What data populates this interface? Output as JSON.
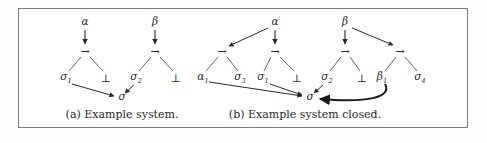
{
  "figure": {
    "frame_color": "#7d7d7d",
    "ink_color": "#2a2a2a",
    "background": "#ffffff",
    "captions": [
      {
        "id": "caption-a",
        "text": "(a) Example system.",
        "x": 122,
        "y": 114
      },
      {
        "id": "caption-b",
        "text": "(b) Example system closed.",
        "x": 305,
        "y": 114
      }
    ],
    "panels": [
      {
        "id": "panel-a",
        "label": "(a) Example system.",
        "nodes": [
          {
            "id": "a-alpha",
            "kind": "variable",
            "text": "α",
            "sub": "",
            "x": 85,
            "y": 23
          },
          {
            "id": "a-arrow1",
            "kind": "operator",
            "text": "→",
            "sub": "",
            "x": 85,
            "y": 51
          },
          {
            "id": "a-sigma1",
            "kind": "variable",
            "text": "σ",
            "sub": "1",
            "x": 66,
            "y": 78
          },
          {
            "id": "a-bot1",
            "kind": "operator",
            "text": "⊥",
            "sub": "",
            "x": 106,
            "y": 78
          },
          {
            "id": "a-beta",
            "kind": "variable",
            "text": "β",
            "sub": "",
            "x": 155,
            "y": 23
          },
          {
            "id": "a-arrow2",
            "kind": "operator",
            "text": "→",
            "sub": "",
            "x": 155,
            "y": 51
          },
          {
            "id": "a-sigma2",
            "kind": "variable",
            "text": "σ",
            "sub": "2",
            "x": 136,
            "y": 78
          },
          {
            "id": "a-bot2",
            "kind": "operator",
            "text": "⊥",
            "sub": "",
            "x": 176,
            "y": 78
          },
          {
            "id": "a-sigma",
            "kind": "variable",
            "text": "σ",
            "sub": "",
            "x": 122,
            "y": 98
          }
        ],
        "edges": [
          {
            "id": "a-edge-alpha-arrow1",
            "from": "a-alpha",
            "to": "a-arrow1",
            "style": "straight-arrow"
          },
          {
            "id": "a-edge-arrow1-sigma1",
            "from": "a-arrow1",
            "to": "a-sigma1",
            "style": "plain-line"
          },
          {
            "id": "a-edge-arrow1-bot1",
            "from": "a-arrow1",
            "to": "a-bot1",
            "style": "plain-line"
          },
          {
            "id": "a-edge-beta-arrow2",
            "from": "a-beta",
            "to": "a-arrow2",
            "style": "straight-arrow"
          },
          {
            "id": "a-edge-arrow2-sigma2",
            "from": "a-arrow2",
            "to": "a-sigma2",
            "style": "plain-line"
          },
          {
            "id": "a-edge-arrow2-bot2",
            "from": "a-arrow2",
            "to": "a-bot2",
            "style": "plain-line"
          },
          {
            "id": "a-edge-sigma1-sigma",
            "from": "a-sigma1",
            "to": "a-sigma",
            "style": "straight-arrow"
          },
          {
            "id": "a-edge-sigma2-sigma",
            "from": "a-sigma2",
            "to": "a-sigma",
            "style": "straight-arrow"
          }
        ]
      },
      {
        "id": "panel-b",
        "label": "(b) Example system closed.",
        "nodes": [
          {
            "id": "b-alpha",
            "kind": "variable",
            "text": "α",
            "sub": "",
            "x": 275,
            "y": 23
          },
          {
            "id": "b-arrow1",
            "kind": "operator",
            "text": "→",
            "sub": "",
            "x": 222,
            "y": 51
          },
          {
            "id": "b-arrow2",
            "kind": "operator",
            "text": "→",
            "sub": "",
            "x": 275,
            "y": 51
          },
          {
            "id": "b-alpha1",
            "kind": "variable",
            "text": "α",
            "sub": "1",
            "x": 203,
            "y": 78
          },
          {
            "id": "b-sigma3",
            "kind": "variable",
            "text": "σ",
            "sub": "3",
            "x": 240,
            "y": 78
          },
          {
            "id": "b-sigma1",
            "kind": "variable",
            "text": "σ",
            "sub": "1",
            "x": 263,
            "y": 78
          },
          {
            "id": "b-bot1",
            "kind": "operator",
            "text": "⊥",
            "sub": "",
            "x": 297,
            "y": 78
          },
          {
            "id": "b-beta",
            "kind": "variable",
            "text": "β",
            "sub": "",
            "x": 345,
            "y": 23
          },
          {
            "id": "b-arrow3",
            "kind": "operator",
            "text": "→",
            "sub": "",
            "x": 345,
            "y": 51
          },
          {
            "id": "b-arrow4",
            "kind": "operator",
            "text": "→",
            "sub": "",
            "x": 400,
            "y": 51
          },
          {
            "id": "b-sigma2",
            "kind": "variable",
            "text": "σ",
            "sub": "2",
            "x": 327,
            "y": 78
          },
          {
            "id": "b-bot2",
            "kind": "operator",
            "text": "⊥",
            "sub": "",
            "x": 362,
            "y": 78
          },
          {
            "id": "b-beta1",
            "kind": "variable",
            "text": "β",
            "sub": "1",
            "x": 382,
            "y": 78
          },
          {
            "id": "b-sigma4",
            "kind": "variable",
            "text": "σ",
            "sub": "4",
            "x": 420,
            "y": 78
          },
          {
            "id": "b-sigma",
            "kind": "variable",
            "text": "σ",
            "sub": "",
            "x": 310,
            "y": 98
          }
        ],
        "edges": [
          {
            "id": "b-edge-alpha-arrow1",
            "from": "b-alpha",
            "to": "b-arrow1",
            "style": "straight-arrow"
          },
          {
            "id": "b-edge-alpha-arrow2",
            "from": "b-alpha",
            "to": "b-arrow2",
            "style": "straight-arrow"
          },
          {
            "id": "b-edge-arrow1-alpha1",
            "from": "b-arrow1",
            "to": "b-alpha1",
            "style": "plain-line"
          },
          {
            "id": "b-edge-arrow1-sigma3",
            "from": "b-arrow1",
            "to": "b-sigma3",
            "style": "plain-line"
          },
          {
            "id": "b-edge-arrow2-sigma1",
            "from": "b-arrow2",
            "to": "b-sigma1",
            "style": "plain-line"
          },
          {
            "id": "b-edge-arrow2-bot1",
            "from": "b-arrow2",
            "to": "b-bot1",
            "style": "plain-line"
          },
          {
            "id": "b-edge-beta-arrow3",
            "from": "b-beta",
            "to": "b-arrow3",
            "style": "straight-arrow"
          },
          {
            "id": "b-edge-beta-arrow4",
            "from": "b-beta",
            "to": "b-arrow4",
            "style": "straight-arrow"
          },
          {
            "id": "b-edge-arrow3-sigma2",
            "from": "b-arrow3",
            "to": "b-sigma2",
            "style": "plain-line"
          },
          {
            "id": "b-edge-arrow3-bot2",
            "from": "b-arrow3",
            "to": "b-bot2",
            "style": "plain-line"
          },
          {
            "id": "b-edge-arrow4-beta1",
            "from": "b-arrow4",
            "to": "b-beta1",
            "style": "plain-line"
          },
          {
            "id": "b-edge-arrow4-sigma4",
            "from": "b-arrow4",
            "to": "b-sigma4",
            "style": "plain-line"
          },
          {
            "id": "b-edge-alpha1-sigma",
            "from": "b-alpha1",
            "to": "b-sigma",
            "style": "straight-arrow"
          },
          {
            "id": "b-edge-sigma1-sigma",
            "from": "b-sigma1",
            "to": "b-sigma",
            "style": "straight-arrow"
          },
          {
            "id": "b-edge-sigma2-sigma",
            "from": "b-sigma2",
            "to": "b-sigma",
            "style": "straight-arrow"
          },
          {
            "id": "b-edge-beta1-sigma",
            "from": "b-beta1",
            "to": "b-sigma",
            "style": "curved-thick-arrow"
          }
        ]
      }
    ]
  }
}
